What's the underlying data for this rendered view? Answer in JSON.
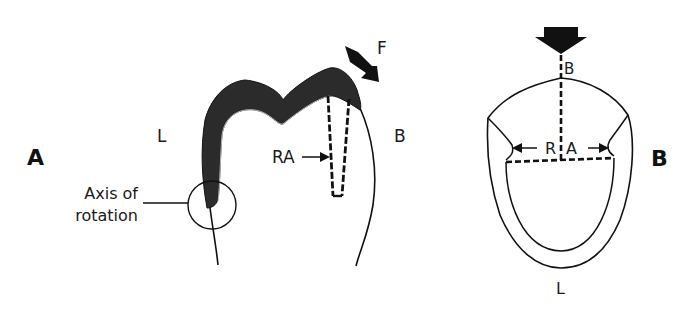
{
  "panels": {
    "a": {
      "panel_label": "A",
      "side_left": "L",
      "side_right": "B",
      "force_label": "F",
      "retention_label": "RA",
      "axis_label_line1": "Axis of",
      "axis_label_line2": "rotation"
    },
    "b": {
      "panel_label": "B",
      "side_top": "B",
      "side_bottom": "L",
      "retention_label_left": "R",
      "retention_label_right": "A"
    }
  },
  "colors": {
    "ink": "#111111",
    "restoration_fill": "#2b2b2b",
    "background": "#ffffff"
  }
}
